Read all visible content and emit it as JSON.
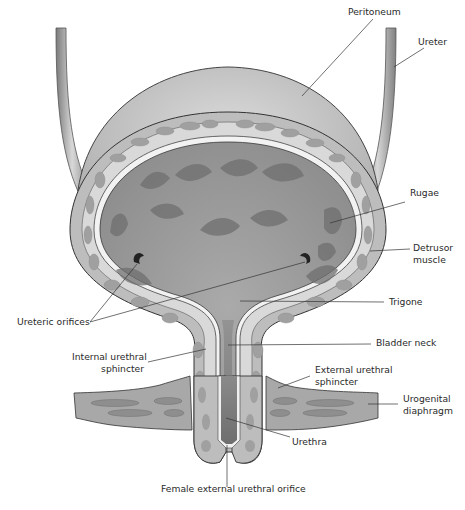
{
  "diagram": {
    "labels": {
      "peritoneum": "Peritoneum",
      "ureter": "Ureter",
      "rugae": "Rugae",
      "detrusor_muscle_1": "Detrusor",
      "detrusor_muscle_2": "muscle",
      "trigone": "Trigone",
      "ureteric_orifices": "Ureteric orifices",
      "bladder_neck": "Bladder neck",
      "internal_urethral_sphincter_1": "Internal urethral",
      "internal_urethral_sphincter_2": "sphincter",
      "external_urethral_sphincter_1": "External urethral",
      "external_urethral_sphincter_2": "sphincter",
      "urogenital_diaphragm_1": "Urogenital",
      "urogenital_diaphragm_2": "diaphragm",
      "urethra": "Urethra",
      "female_external_urethral_orifice": "Female external urethral orifice"
    },
    "colors": {
      "peritoneum": "#c9c9c9",
      "muscle_wall": "#bdbdbd",
      "muscle_cells": "#a3a3a3",
      "lumen": "#9c9c9c",
      "rugae": "#6f6f6f",
      "diaphragm": "#a8a8a8",
      "leader_line": "#333333"
    }
  }
}
